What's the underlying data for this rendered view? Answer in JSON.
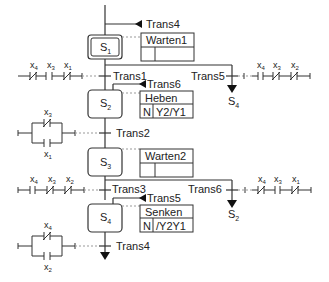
{
  "diagram": {
    "type": "sequential-function-chart",
    "steps": [
      {
        "id": "S1",
        "base": "S",
        "sub": "1",
        "initial": true,
        "action": {
          "name": "Warten1",
          "qualifier": "",
          "value": ""
        }
      },
      {
        "id": "S2",
        "base": "S",
        "sub": "2",
        "initial": false,
        "action": {
          "name": "Heben",
          "qualifier": "N",
          "value": "Y2/Y1"
        }
      },
      {
        "id": "S3",
        "base": "S",
        "sub": "3",
        "initial": false,
        "action": {
          "name": "Warten2",
          "qualifier": "",
          "value": ""
        }
      },
      {
        "id": "S4",
        "base": "S",
        "sub": "4",
        "initial": false,
        "action": {
          "name": "Senken",
          "qualifier": "N",
          "value": "/Y2Y1"
        }
      }
    ],
    "transitions": {
      "trans1": "Trans1",
      "trans2": "Trans2",
      "trans3": "Trans3",
      "trans4": "Trans4",
      "trans5": "Trans5",
      "trans6": "Trans6",
      "entry_top": "Trans4",
      "entry_s2": "Trans6",
      "entry_s4": "Trans5"
    },
    "jumps": {
      "trans5_target": {
        "base": "S",
        "sub": "4"
      },
      "trans6_target": {
        "base": "S",
        "sub": "2"
      }
    },
    "contacts": {
      "trans1": [
        {
          "base": "x",
          "sub": "4",
          "type": "NC"
        },
        {
          "base": "x",
          "sub": "3",
          "type": "NO"
        },
        {
          "base": "x",
          "sub": "1",
          "type": "NC"
        }
      ],
      "trans5": [
        {
          "base": "x",
          "sub": "4",
          "type": "NO"
        },
        {
          "base": "x",
          "sub": "3",
          "type": "NC"
        },
        {
          "base": "x",
          "sub": "2",
          "type": "NC"
        }
      ],
      "trans2": [
        {
          "base": "x",
          "sub": "3",
          "type": "NC",
          "branch": "top"
        },
        {
          "base": "x",
          "sub": "1",
          "type": "NO",
          "branch": "bottom"
        }
      ],
      "trans3": [
        {
          "base": "x",
          "sub": "4",
          "type": "NO"
        },
        {
          "base": "x",
          "sub": "3",
          "type": "NC"
        },
        {
          "base": "x",
          "sub": "2",
          "type": "NC"
        }
      ],
      "trans6": [
        {
          "base": "x",
          "sub": "4",
          "type": "NC"
        },
        {
          "base": "x",
          "sub": "3",
          "type": "NO"
        },
        {
          "base": "x",
          "sub": "1",
          "type": "NC"
        }
      ],
      "trans4": [
        {
          "base": "x",
          "sub": "4",
          "type": "NC",
          "branch": "top"
        },
        {
          "base": "x",
          "sub": "2",
          "type": "NO",
          "branch": "bottom"
        }
      ]
    }
  }
}
